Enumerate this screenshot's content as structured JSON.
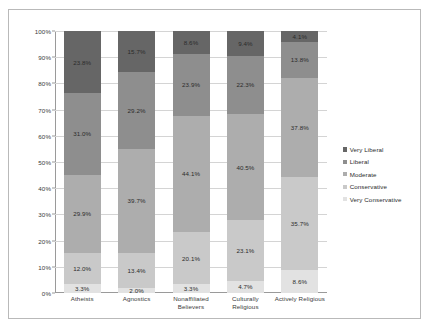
{
  "chart_data": {
    "type": "bar",
    "subtype": "100% stacked column",
    "title": "",
    "xlabel": "",
    "ylabel": "",
    "ylim": [
      0,
      100
    ],
    "ytick_labels": [
      "0%",
      "10%",
      "20%",
      "30%",
      "40%",
      "50%",
      "60%",
      "70%",
      "80%",
      "90%",
      "100%"
    ],
    "ytick_values": [
      0,
      10,
      20,
      30,
      40,
      50,
      60,
      70,
      80,
      90,
      100
    ],
    "grid": true,
    "legend_position": "right",
    "categories": [
      "Atheists",
      "Agnostics",
      "Nonaffiliated Believers",
      "Culturally Religious",
      "Actively Religious"
    ],
    "series": [
      {
        "name": "Very Conservative",
        "color": "#e2e2e2",
        "values": [
          3.3,
          2.0,
          3.3,
          4.7,
          8.6
        ],
        "labels": [
          "3.3%",
          "2.0%",
          "3.3%",
          "4.7%",
          "8.6%"
        ]
      },
      {
        "name": "Conservative",
        "color": "#c9c9c9",
        "values": [
          12.0,
          13.4,
          20.1,
          23.1,
          35.7
        ],
        "labels": [
          "12.0%",
          "13.4%",
          "20.1%",
          "23.1%",
          "35.7%"
        ]
      },
      {
        "name": "Moderate",
        "color": "#adadad",
        "values": [
          29.9,
          39.7,
          44.1,
          40.5,
          37.8
        ],
        "labels": [
          "29.9%",
          "39.7%",
          "44.1%",
          "40.5%",
          "37.8%"
        ]
      },
      {
        "name": "Liberal",
        "color": "#8e8e8e",
        "values": [
          31.0,
          29.2,
          23.9,
          22.3,
          13.8
        ],
        "labels": [
          "31.0%",
          "29.2%",
          "23.9%",
          "22.3%",
          "13.8%"
        ]
      },
      {
        "name": "Very Liberal",
        "color": "#666666",
        "values": [
          23.8,
          15.7,
          8.6,
          9.4,
          4.1
        ],
        "labels": [
          "23.8%",
          "15.7%",
          "8.6%",
          "9.4%",
          "4.1%"
        ]
      }
    ],
    "legend_entries": [
      {
        "label": "Very Liberal",
        "color": "#666666"
      },
      {
        "label": "Liberal",
        "color": "#8e8e8e"
      },
      {
        "label": "Moderate",
        "color": "#adadad"
      },
      {
        "label": "Conservative",
        "color": "#c9c9c9"
      },
      {
        "label": "Very Conservative",
        "color": "#e2e2e2"
      }
    ]
  }
}
